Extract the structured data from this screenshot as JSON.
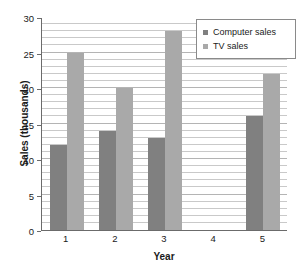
{
  "chart_data": {
    "type": "bar",
    "title": "",
    "xlabel": "Year",
    "ylabel": "Sales (thousands)",
    "categories": [
      "1",
      "2",
      "3",
      "4",
      "5"
    ],
    "series": [
      {
        "name": "Computer sales",
        "color": "#808080",
        "values": [
          12,
          14,
          13,
          0,
          16
        ]
      },
      {
        "name": "TV sales",
        "color": "#a9a9a9",
        "values": [
          25,
          20,
          28,
          0,
          22
        ]
      }
    ],
    "ylim": [
      0,
      30
    ],
    "y_ticks": [
      0,
      5,
      10,
      15,
      20,
      25,
      30
    ],
    "y_tick_labels": [
      "0",
      "5",
      "10",
      "15",
      "20",
      "25",
      "30"
    ],
    "grid": true,
    "grid_minor_step": 1,
    "legend_position": "top-right",
    "legend_entries": [
      "Computer sales",
      "TV sales"
    ]
  },
  "axes": {
    "y_title": "Sales (thousands)",
    "x_title": "Year"
  },
  "colors": {
    "computer_sales": "#808080",
    "tv_sales": "#a9a9a9",
    "gridline": "#c9c9c9",
    "axis": "#6b6b6b",
    "legend_border": "#8a8a8a",
    "text": "#1a1a1a"
  }
}
